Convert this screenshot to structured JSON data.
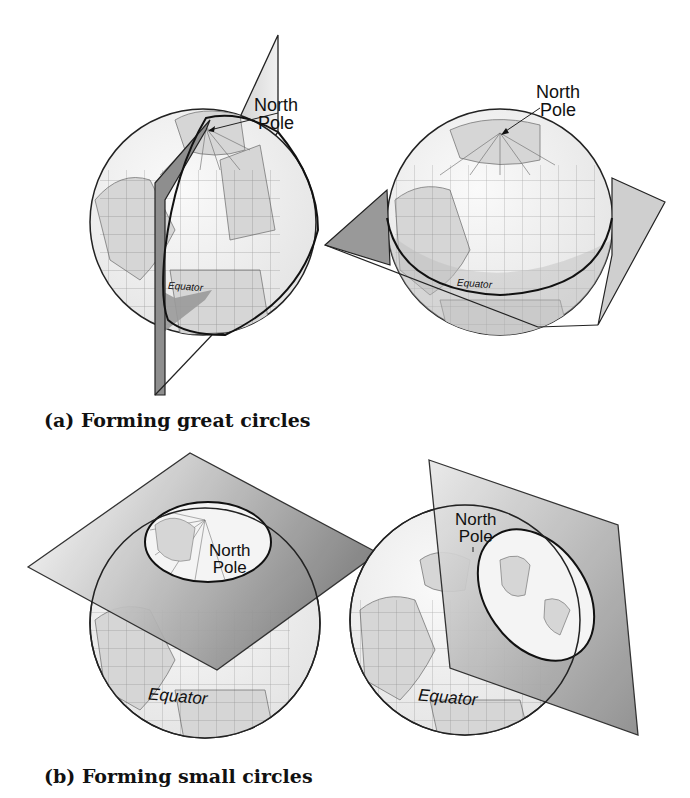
{
  "figure": {
    "panels": [
      {
        "id": "a",
        "caption": "(a) Forming great circles",
        "globes": [
          {
            "pole_label_line1": "North",
            "pole_label_line2": "Pole",
            "equator_label": "Equator",
            "plane": "vertical plane through poles"
          },
          {
            "pole_label_line1": "North",
            "pole_label_line2": "Pole",
            "equator_label": "Equator",
            "plane": "horizontal plane through equator"
          }
        ]
      },
      {
        "id": "b",
        "caption": "(b) Forming small circles",
        "globes": [
          {
            "pole_label_line1": "North",
            "pole_label_line2": "Pole",
            "equator_label": "Equator",
            "plane": "horizontal plane near pole"
          },
          {
            "pole_label_line1": "North",
            "pole_label_line2": "Pole",
            "equator_label": "Equator",
            "plane": "tilted plane off-center"
          }
        ]
      }
    ]
  },
  "colors": {
    "plane_dark": "#8a8a8a",
    "plane_light": "#e6e6e6",
    "globe_fill": "#f2f2f2",
    "land": "#d4d4d4",
    "outline": "#222222"
  }
}
